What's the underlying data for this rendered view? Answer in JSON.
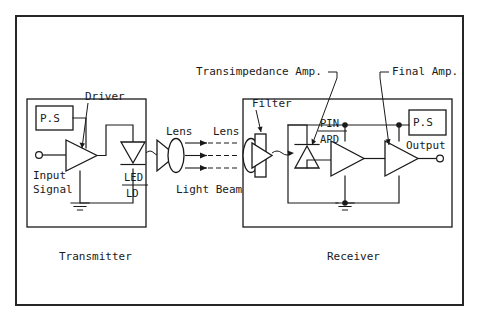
{
  "diagram": {
    "background_color": "#ffffff",
    "line_color": "#1a1a1a",
    "sections": {
      "transmitter_label": "Transmitter",
      "receiver_label": "Receiver"
    },
    "transmitter": {
      "power_supply_label": "P.S",
      "driver_label": "Driver",
      "input_label_line1": "Input",
      "input_label_line2": "Signal",
      "source_label_top": "LED",
      "source_label_bottom": "LD"
    },
    "optics": {
      "lens_tx_label": "Lens",
      "lens_rx_label": "Lens",
      "light_beam_label": "Light Beam",
      "beam_count": 3
    },
    "receiver": {
      "filter_label": "Filter",
      "detector_label_top": "PIN",
      "detector_label_bottom": "APD",
      "transimpedance_label": "Transimpedance Amp.",
      "final_amp_label": "Final Amp.",
      "power_supply_label": "P.S",
      "output_label": "Output"
    }
  }
}
